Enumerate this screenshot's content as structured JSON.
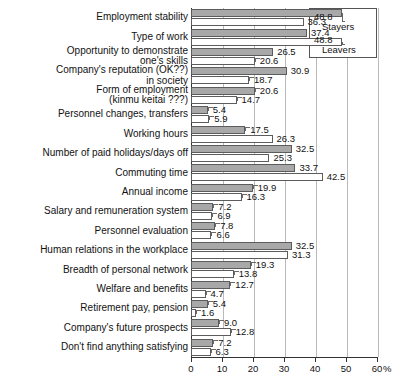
{
  "chart_data": {
    "type": "bar",
    "orientation": "horizontal",
    "title": "",
    "subtitle": "",
    "xlabel": "%",
    "ylabel": "",
    "xlim": [
      0,
      60
    ],
    "xticks": [
      0,
      10,
      20,
      30,
      40,
      50,
      60
    ],
    "xtick_labels": [
      "0",
      "10",
      "20",
      "30",
      "40",
      "50",
      "60"
    ],
    "axis_unit": "%",
    "grid": true,
    "grid_axis": "x",
    "legend_position": "top-right",
    "categories": [
      "Employment stability",
      "Type of work",
      "Opportunity to demonstrate\none's skills",
      "Company's reputation (OK??)\nin society",
      "Form of employment\n(kinmu keitai ???)",
      "Personnel changes, transfers",
      "Working hours",
      "Number of paid holidays/days off",
      "Commuting time",
      "Annual income",
      "Salary and remuneration system",
      "Personnel evaluation",
      "Human relations in the workplace",
      "Breadth of personal network",
      "Welfare and benefits",
      "Retirement pay, pension",
      "Company's future prospects",
      "Don't find anything satisfying"
    ],
    "series": [
      {
        "name": "Stayers",
        "color": "#a8a8a8",
        "values": [
          48.8,
          37.4,
          26.5,
          30.9,
          20.6,
          5.4,
          17.5,
          32.5,
          33.7,
          19.9,
          7.2,
          7.8,
          32.5,
          19.3,
          12.7,
          5.4,
          9.0,
          7.2
        ]
      },
      {
        "name": "Leavers",
        "color": "#ffffff",
        "values": [
          36.3,
          48.8,
          20.6,
          18.7,
          14.7,
          5.9,
          26.3,
          25.3,
          42.5,
          16.3,
          6.9,
          6.6,
          31.3,
          13.8,
          4.7,
          1.6,
          12.8,
          6.3
        ]
      }
    ]
  },
  "legend": {
    "entries": [
      {
        "label": "Stayers",
        "value": "48.8",
        "swatch": "gray"
      },
      {
        "label": "Leavers",
        "value": "48.8",
        "swatch": "white"
      }
    ]
  }
}
